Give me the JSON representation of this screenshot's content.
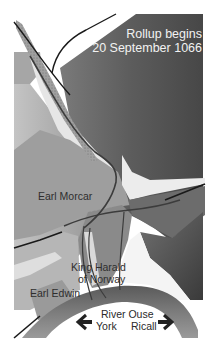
{
  "title": {
    "line1": "Rollup begins",
    "line2": "20 September 1066"
  },
  "labels": {
    "earl_morcar": "Earl Morcar",
    "king_harald_line1": "King Harald",
    "king_harald_line2": "of Norway",
    "earl_edwin": "Earl Edwin",
    "river": "River Ouse",
    "york": "York",
    "ricall": "Ricall"
  },
  "icons": {
    "arrow_left": "arrow-left-icon",
    "arrow_right": "arrow-right-icon"
  },
  "colors": {
    "background": "#ffffff",
    "dark_high_ground": "#5a5a5a",
    "mid_ground": "#8c8c8c",
    "light_ground": "#a8a8a8",
    "marsh": "#c8c8c8",
    "river": "#6e6e6e",
    "road": "#1a1a1a",
    "troop_line": "#3c3c3c",
    "title_text": "#f2f2f2",
    "label_text": "#2e2e2e"
  }
}
